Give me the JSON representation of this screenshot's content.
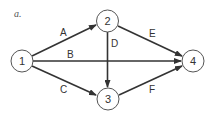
{
  "figure": {
    "label": "a.",
    "colors": {
      "edge": "#333333",
      "node_stroke": "#555555",
      "node_fill": "#ffffff",
      "text": "#333333"
    }
  },
  "nodes": [
    {
      "id": "1",
      "label": "1"
    },
    {
      "id": "2",
      "label": "2"
    },
    {
      "id": "3",
      "label": "3"
    },
    {
      "id": "4",
      "label": "4"
    }
  ],
  "edges": [
    {
      "label": "A",
      "from": "1",
      "to": "2"
    },
    {
      "label": "B",
      "from": "1",
      "to": "4"
    },
    {
      "label": "C",
      "from": "1",
      "to": "3"
    },
    {
      "label": "D",
      "from": "2",
      "to": "3"
    },
    {
      "label": "E",
      "from": "2",
      "to": "4"
    },
    {
      "label": "F",
      "from": "3",
      "to": "4"
    }
  ]
}
